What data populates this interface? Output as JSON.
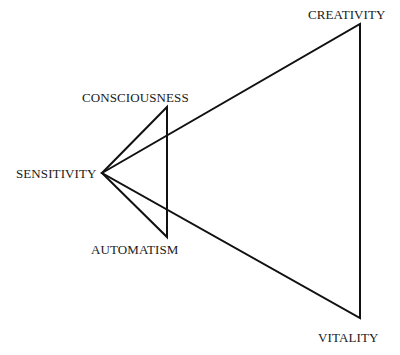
{
  "diagram": {
    "nodes": [
      {
        "id": "sensitivity",
        "label": "SENSITIVITY",
        "x": 102,
        "y": 173
      },
      {
        "id": "consciousness",
        "label": "CONSCIOUSNESS",
        "x": 167,
        "y": 107
      },
      {
        "id": "automatism",
        "label": "AUTOMATISM",
        "x": 167,
        "y": 237
      },
      {
        "id": "creativity",
        "label": "CREATIVITY",
        "x": 360,
        "y": 24
      },
      {
        "id": "vitality",
        "label": "VITALITY",
        "x": 360,
        "y": 318
      }
    ],
    "edges": [
      {
        "from": "sensitivity",
        "to": "consciousness"
      },
      {
        "from": "consciousness",
        "to": "automatism"
      },
      {
        "from": "automatism",
        "to": "sensitivity"
      },
      {
        "from": "sensitivity",
        "to": "creativity"
      },
      {
        "from": "creativity",
        "to": "vitality"
      },
      {
        "from": "vitality",
        "to": "sensitivity"
      }
    ],
    "stroke_color": "#111111"
  }
}
